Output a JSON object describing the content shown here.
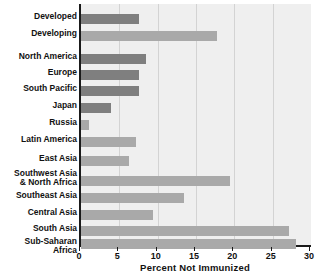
{
  "chart_data": {
    "type": "bar",
    "orientation": "horizontal",
    "title": "",
    "xlabel": "Percent Not Immunized",
    "ylabel": "",
    "xlim": [
      0,
      30
    ],
    "xticks": [
      0,
      5,
      10,
      15,
      20,
      25,
      30
    ],
    "xticklabels": [
      "0",
      "5",
      "10",
      "15",
      "20",
      "25",
      "30"
    ],
    "grid": "vertical",
    "legend": "none",
    "categories": [
      "Developed",
      "Developing",
      "North America",
      "Europe",
      "South Pacific",
      "Japan",
      "Russia",
      "Latin America",
      "East Asia",
      "Southwest Asia\n& North Africa",
      "Southeast Asia",
      "Central Asia",
      "South Asia",
      "Sub-Saharan Africa"
    ],
    "values": [
      7.5,
      17.7,
      8.5,
      7.5,
      7.5,
      3.9,
      1.0,
      7.2,
      6.2,
      19.4,
      13.4,
      9.4,
      27.1,
      28.0
    ],
    "bar_colors": [
      "#7f7f7f",
      "#a9a9a9",
      "#7f7f7f",
      "#7f7f7f",
      "#7f7f7f",
      "#7f7f7f",
      "#a9a9a9",
      "#a9a9a9",
      "#a9a9a9",
      "#a9a9a9",
      "#a9a9a9",
      "#a9a9a9",
      "#a9a9a9",
      "#a9a9a9"
    ],
    "row_tops": [
      10,
      27,
      50,
      66,
      82,
      99,
      116,
      133,
      152,
      172,
      189,
      206,
      222,
      235
    ],
    "label_tops": [
      8,
      25,
      48,
      64,
      80,
      97,
      114,
      131,
      150,
      165,
      187,
      204,
      220,
      233
    ],
    "colors": {
      "plot_background": "#efefef",
      "page_background": "#ffffff",
      "axis": "#1a1a1a",
      "gridline": "#d3d3d3",
      "text": "#111111",
      "bar_dark": "#7f7f7f",
      "bar_light": "#a9a9a9"
    }
  }
}
